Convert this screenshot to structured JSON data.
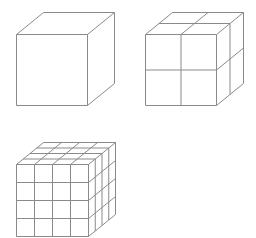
{
  "figure": {
    "line_color": "#8a8a8a",
    "background": "#ffffff"
  },
  "cubes": [
    {
      "name": "cube-1x1x1",
      "divisions": 1,
      "front_x": 16,
      "front_top_y": 34,
      "size": 71,
      "depth_dx": 27,
      "depth_dy": 22
    },
    {
      "name": "cube-2x2x2",
      "divisions": 2,
      "front_x": 145,
      "front_top_y": 34,
      "size": 71,
      "depth_dx": 27,
      "depth_dy": 22
    },
    {
      "name": "cube-4x4x4",
      "divisions": 4,
      "front_x": 16,
      "front_top_y": 164,
      "size": 72,
      "depth_dx": 27,
      "depth_dy": 22
    }
  ]
}
